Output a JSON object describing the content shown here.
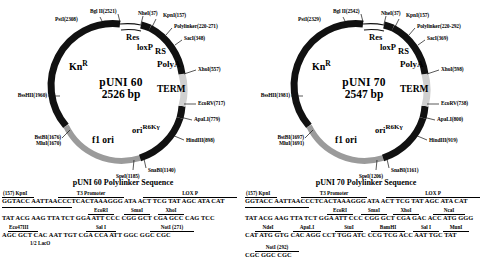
{
  "figure": {
    "panels": [
      {
        "id": "puni60",
        "map": {
          "name": "pUNI 60",
          "size": "2526 bp",
          "features": [
            {
              "name": "KnR",
              "label_main": "Kn",
              "label_sup": "R"
            },
            {
              "name": "Res",
              "label_main": "Res"
            },
            {
              "name": "loxP",
              "label_main": "loxP"
            },
            {
              "name": "RS",
              "label_main": "RS"
            },
            {
              "name": "PolyA",
              "label_main": "PolyA"
            },
            {
              "name": "TERM",
              "label_main": "TERM"
            },
            {
              "name": "oriR6Kgamma",
              "label_main": "ori",
              "label_sup": "R6Kγ"
            },
            {
              "name": "f1ori",
              "label_main": "f1 ori"
            }
          ],
          "sites": [
            {
              "name": "bglii",
              "text": "Bgl II(2521)"
            },
            {
              "name": "psti",
              "text": "PstI(2308)"
            },
            {
              "name": "nhei",
              "text": "NheI(37)"
            },
            {
              "name": "kpni",
              "text": "KpnI(157)"
            },
            {
              "name": "polylinker",
              "text": "Polylinker(220-271)"
            },
            {
              "name": "saci",
              "text": "SacI(348)"
            },
            {
              "name": "xhoi",
              "text": "XhoI(557)"
            },
            {
              "name": "ecorv",
              "text": "EcoRV(717)"
            },
            {
              "name": "apali",
              "text": "ApaLI(779)"
            },
            {
              "name": "hindiii",
              "text": "HindIII(898)"
            },
            {
              "name": "snabi",
              "text": "SnaBI(1140)"
            },
            {
              "name": "spei",
              "text": "SpeI(1185)"
            },
            {
              "name": "bstbi-mlui",
              "text": "BstBI(1676)\nMluI(1670)"
            },
            {
              "name": "bsshii",
              "text": "BssHII(1960)"
            }
          ]
        },
        "sequence": {
          "title": "pUNI 60 Polylinker Sequence",
          "rows": [
            {
              "annotations": [
                {
                  "text": "(157) KpnI",
                  "left": 2,
                  "width": 30
                },
                {
                  "text": "T3 Promoter",
                  "left": 58,
                  "width": 64
                },
                {
                  "text": "LOX P",
                  "left": 143,
                  "width": 92
                }
              ],
              "bases": "GGTACC  AATTAACCCTCACTAAAGGG  ATA ACT TCG TAT AGC ATA CAT"
            },
            {
              "annotations": [
                {
                  "text": "",
                  "left": 2,
                  "width": 68
                },
                {
                  "text": "EcoRI",
                  "left": 88,
                  "width": 24
                },
                {
                  "text": "SmaI",
                  "left": 124,
                  "width": 24
                },
                {
                  "text": "XhoI",
                  "left": 158,
                  "width": 24
                }
              ],
              "bases": "TAT ACG AAG TTA TCT GGA ATT  CCC CGG GCT  CGA  GCC  CAG TCC"
            },
            {
              "annotations": [
                {
                  "text": "Eco47III",
                  "left": 8,
                  "width": 28
                },
                {
                  "text": "Sal I",
                  "left": 86,
                  "width": 28
                },
                {
                  "text": "NotI (271)",
                  "left": 150,
                  "width": 42
                }
              ],
              "bases": "AGC GCT  CAC AAT  TGT  CGA CCA ATT GGC GGC CGC",
              "subnote": "1/2 LacO"
            }
          ]
        }
      },
      {
        "id": "puni70",
        "map": {
          "name": "pUNI 70",
          "size": "2547 bp",
          "features": [
            {
              "name": "KnR",
              "label_main": "Kn",
              "label_sup": "R"
            },
            {
              "name": "Res",
              "label_main": "Res"
            },
            {
              "name": "loxP",
              "label_main": "loxP"
            },
            {
              "name": "RS",
              "label_main": "RS"
            },
            {
              "name": "PolyA",
              "label_main": "PolyA"
            },
            {
              "name": "TERM",
              "label_main": "TERM"
            },
            {
              "name": "oriR6Kgamma",
              "label_main": "ori",
              "label_sup": "R6Kγ"
            },
            {
              "name": "f1ori",
              "label_main": "f1 ori"
            }
          ],
          "sites": [
            {
              "name": "bglii",
              "text": "Bgl II(2542)"
            },
            {
              "name": "psti",
              "text": "PstI(2329)"
            },
            {
              "name": "nhei",
              "text": "NheI(37)"
            },
            {
              "name": "kpni",
              "text": "KpnI(157)"
            },
            {
              "name": "polylinker",
              "text": "Polylinker(220-292)"
            },
            {
              "name": "saci",
              "text": "SacI(369)"
            },
            {
              "name": "xhoi",
              "text": "XhoI(598)"
            },
            {
              "name": "ecorv",
              "text": "EcoRV(738)"
            },
            {
              "name": "apali",
              "text": "ApaLI(800)"
            },
            {
              "name": "hindiii",
              "text": "HindIII(919)"
            },
            {
              "name": "snabi",
              "text": "SnaBI(1161)"
            },
            {
              "name": "spei",
              "text": "SpeI(1206)"
            },
            {
              "name": "bstbi-mlui",
              "text": "BstBI(1697)\nMluI(1691)"
            },
            {
              "name": "bsshii",
              "text": "BssHII(1981)"
            }
          ]
        },
        "sequence": {
          "title": "pUNI 70 Polylinker Sequence",
          "rows": [
            {
              "annotations": [
                {
                  "text": "(157) KpnI",
                  "left": 2,
                  "width": 30
                },
                {
                  "text": "T3 Promoter",
                  "left": 58,
                  "width": 64
                },
                {
                  "text": "LOX P",
                  "left": 143,
                  "width": 92
                }
              ],
              "bases": "GGTACC  AATTAACCCTCACTAAAGGG  ATA ACT TCG TAT AGC ATA CAT"
            },
            {
              "annotations": [
                {
                  "text": "",
                  "left": 2,
                  "width": 62
                },
                {
                  "text": "EcoRI",
                  "left": 84,
                  "width": 24
                },
                {
                  "text": "SmaI",
                  "left": 118,
                  "width": 24
                },
                {
                  "text": "XhoI",
                  "left": 150,
                  "width": 24
                },
                {
                  "text": "NcaI",
                  "left": 190,
                  "width": 30
                }
              ],
              "bases": "TAT ACG AAG TTA  TCT GGA ATT CCC CGG GCT CGA GAC ACC ATG GGG"
            },
            {
              "annotations": [
                {
                  "text": "NdeI",
                  "left": 12,
                  "width": 24
                },
                {
                  "text": "ApaLI",
                  "left": 50,
                  "width": 26
                },
                {
                  "text": "StuI",
                  "left": 92,
                  "width": 26
                },
                {
                  "text": "BamHI",
                  "left": 128,
                  "width": 32
                },
                {
                  "text": "Sal I",
                  "left": 170,
                  "width": 24
                },
                {
                  "text": "MunI",
                  "left": 200,
                  "width": 24
                }
              ],
              "bases": "CAT ATG GTG CAC AGG CCT TGG ATC CCG TCG ACC AAT TGC TAT"
            },
            {
              "annotations": [
                {
                  "text": "NotI (292)",
                  "left": 12,
                  "width": 42
                }
              ],
              "bases": "CGC GGC CGC"
            }
          ]
        }
      }
    ]
  },
  "colors": {
    "black": "#111111",
    "grey": "#9b9b9b",
    "light": "#d8d8d8",
    "white": "#ffffff"
  }
}
